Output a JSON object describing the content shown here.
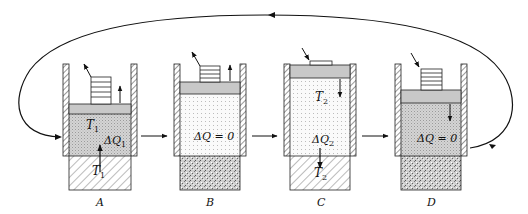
{
  "diagram": {
    "type": "thermodynamic-cycle",
    "stages": [
      {
        "id": "A",
        "label": "A",
        "gas_temp": "T",
        "gas_temp_sub": "1",
        "heat": "ΔQ",
        "heat_sub": "1",
        "reservoir_temp": "T",
        "reservoir_temp_sub": "1",
        "reservoir": "hot-hatched",
        "piston_motion": "up",
        "weight_motion": "removed"
      },
      {
        "id": "B",
        "label": "B",
        "heat": "ΔQ = 0",
        "reservoir": "insulator",
        "piston_motion": "up",
        "weight_motion": "removed"
      },
      {
        "id": "C",
        "label": "C",
        "gas_temp": "T",
        "gas_temp_sub": "2",
        "heat": "ΔQ",
        "heat_sub": "2",
        "reservoir_temp": "T",
        "reservoir_temp_sub": "2",
        "reservoir": "cold-hatched",
        "piston_motion": "down",
        "weight_motion": "added"
      },
      {
        "id": "D",
        "label": "D",
        "heat": "ΔQ = 0",
        "reservoir": "insulator",
        "piston_motion": "down",
        "weight_motion": "added"
      }
    ],
    "colors": {
      "ink": "#111111",
      "piston": "#c8c8c8",
      "gas_dense": "#d8d8d8",
      "gas_light": "#f2f2f2",
      "background": "#ffffff"
    }
  }
}
